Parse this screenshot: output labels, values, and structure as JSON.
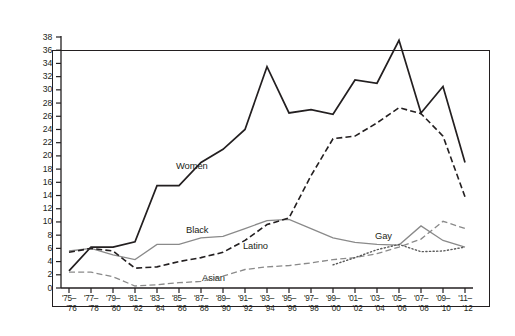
{
  "chart_data": {
    "type": "line",
    "title": "",
    "subtitle": "",
    "xlabel": "",
    "ylabel": "",
    "ylim": [
      0,
      38
    ],
    "ytick_step": 2,
    "grid": false,
    "legend": "inline-labels",
    "yticks": [
      38,
      36,
      34,
      32,
      30,
      28,
      26,
      24,
      22,
      20,
      18,
      16,
      14,
      12,
      10,
      8,
      6,
      4,
      2,
      0
    ],
    "categories": [
      "'75–'76",
      "'77–'78",
      "'79–'80",
      "'81–'82",
      "'83–'84",
      "'85–'86",
      "'87–'88",
      "'89–'90",
      "'91–'92",
      "'93–'94",
      "'95–'96",
      "'97–'98",
      "'99–'00",
      "'01–'02",
      "'03–'04",
      "'05–'06",
      "'07–'08",
      "'09–'10",
      "'11–'12"
    ],
    "categories_top": [
      "'75–",
      "'77–",
      "'79–",
      "'81–",
      "'83–",
      "'85–",
      "'87–",
      "'89–",
      "'91–",
      "'93–",
      "'95–",
      "'97–",
      "'99–",
      "'01–",
      "'03–",
      "'05–",
      "'07–",
      "'09–",
      "'11–"
    ],
    "categories_bottom": [
      "'76",
      "'78",
      "'80",
      "'82",
      "'84",
      "'86",
      "'88",
      "'90",
      "'92",
      "'94",
      "'96",
      "'98",
      "'00",
      "'02",
      "'04",
      "'06",
      "'08",
      "'10",
      "'12"
    ],
    "series": [
      {
        "name": "Women",
        "label": "Women",
        "color": "#231f20",
        "style": "solid",
        "width": 1.7,
        "values": [
          2.6,
          6.2,
          6.2,
          7.0,
          15.5,
          15.5,
          19.0,
          21.0,
          24.0,
          33.5,
          26.5,
          27.0,
          26.3,
          31.5,
          31.0,
          37.5,
          26.5,
          30.5,
          19.0
        ]
      },
      {
        "name": "Black",
        "label": "Black",
        "color": "#8a8a8a",
        "style": "solid",
        "width": 1.3,
        "values": [
          5.6,
          6.0,
          5.0,
          4.3,
          6.6,
          6.6,
          7.6,
          7.8,
          9.0,
          10.2,
          10.4,
          9.0,
          7.6,
          6.9,
          6.6,
          6.5,
          9.4,
          7.2,
          6.2
        ]
      },
      {
        "name": "Latino",
        "label": "Latino",
        "color": "#231f20",
        "style": "dashed",
        "width": 1.6,
        "values": [
          5.4,
          6.0,
          5.6,
          3.0,
          3.2,
          4.0,
          4.6,
          5.4,
          7.2,
          9.6,
          10.6,
          17.0,
          22.6,
          23.0,
          25.0,
          27.3,
          26.4,
          23.0,
          13.8
        ]
      },
      {
        "name": "Asian",
        "label": "Asian",
        "color": "#8a8a8a",
        "style": "dashed",
        "width": 1.3,
        "values": [
          2.4,
          2.4,
          1.7,
          0.3,
          0.5,
          0.8,
          1.0,
          1.8,
          2.8,
          3.2,
          3.4,
          3.8,
          4.3,
          4.6,
          5.2,
          6.2,
          7.4,
          10.1,
          9.0
        ]
      },
      {
        "name": "Gay",
        "label": "Gay",
        "color": "#5a5a5a",
        "style": "dotted",
        "width": 1.4,
        "values": [
          null,
          null,
          null,
          null,
          null,
          null,
          null,
          null,
          null,
          null,
          null,
          null,
          3.5,
          4.6,
          5.8,
          6.6,
          5.5,
          5.6,
          6.2
        ]
      }
    ],
    "annotations": [
      {
        "text": "Women",
        "series": "Women",
        "x_px": 176,
        "y_px": 160
      },
      {
        "text": "Black",
        "series": "Black",
        "x_px": 186,
        "y_px": 224
      },
      {
        "text": "Latino",
        "series": "Latino",
        "x_px": 243,
        "y_px": 240
      },
      {
        "text": "Asian",
        "series": "Asian",
        "x_px": 202,
        "y_px": 272
      },
      {
        "text": "Gay",
        "series": "Gay",
        "x_px": 375,
        "y_px": 230
      }
    ]
  }
}
